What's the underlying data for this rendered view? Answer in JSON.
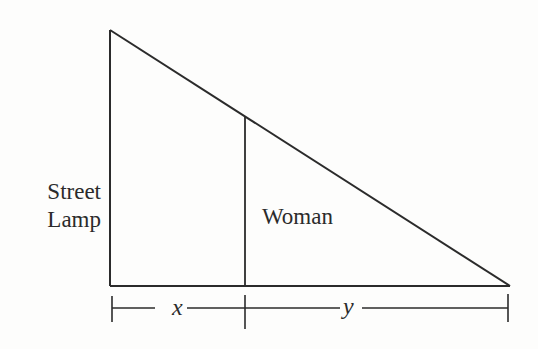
{
  "diagram": {
    "type": "similar-triangles",
    "colors": {
      "background": "#fdfdfc",
      "stroke": "#2b2b2b"
    },
    "labels": {
      "lamp_line1": "Street",
      "lamp_line2": "Lamp",
      "woman": "Woman",
      "x_var": "x",
      "y_var": "y"
    },
    "shapes": {
      "lamp_top": [
        110,
        30
      ],
      "base_left": [
        110,
        286
      ],
      "base_right": [
        510,
        286
      ],
      "woman_top": [
        245,
        116
      ],
      "woman_bottom": [
        245,
        286
      ]
    },
    "dimension": {
      "y": 308,
      "ticks_x": [
        112,
        245,
        508
      ],
      "segments": [
        {
          "name": "x",
          "from": 112,
          "to": 245
        },
        {
          "name": "y",
          "from": 245,
          "to": 508
        }
      ]
    }
  }
}
